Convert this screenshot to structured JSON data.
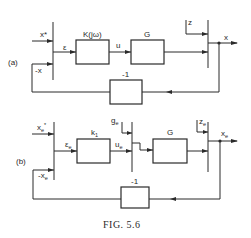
{
  "figure": {
    "caption": "FIG. 5.6",
    "colors": {
      "line": "#2a2a2a",
      "background": "#ffffff"
    }
  },
  "diagram_a": {
    "label": "(a)",
    "inputs": {
      "reference": "x*",
      "feedback": "-x",
      "disturbance": "z"
    },
    "error_signal": "ε",
    "control_signal": "u",
    "output": "x",
    "blocks": [
      {
        "id": "controller",
        "label": "K(jω)"
      },
      {
        "id": "plant",
        "label": "G"
      },
      {
        "id": "feedback",
        "label": "-1"
      }
    ]
  },
  "diagram_b": {
    "label": "(b)",
    "inputs": {
      "reference": "x",
      "reference_sub": "e",
      "reference_sup": "*",
      "feedback": "-x",
      "feedback_sub": "e",
      "disturbance_g": "g",
      "disturbance_g_sub": "e",
      "disturbance_z": "z",
      "disturbance_z_sub": "e"
    },
    "error_signal": "ε",
    "error_signal_sub": "e",
    "control_signal": "u",
    "control_signal_sub": "e",
    "output": "x",
    "output_sub": "e",
    "blocks": [
      {
        "id": "controller",
        "label": "k",
        "sub": "1"
      },
      {
        "id": "plant",
        "label": "G"
      },
      {
        "id": "feedback",
        "label": "-1"
      }
    ]
  }
}
